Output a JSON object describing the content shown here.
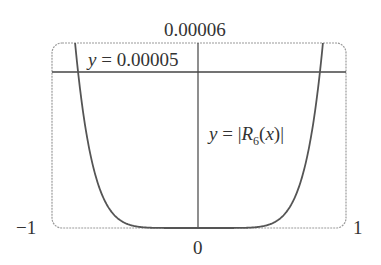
{
  "chart_data": {
    "type": "line",
    "title": "",
    "xlabel": "",
    "ylabel": "",
    "xlim": [
      -1,
      1
    ],
    "ylim": [
      0,
      6e-05
    ],
    "x_tick_labels": [
      "-1",
      "0",
      "1"
    ],
    "y_tick_labels": [
      "0.00006"
    ],
    "grid": false,
    "series": [
      {
        "name": "y = |R6(x)|",
        "function": "|x|^7/5040",
        "x": [
          -0.84,
          -0.82,
          -0.8,
          -0.75,
          -0.7,
          -0.6,
          -0.5,
          -0.4,
          -0.3,
          -0.2,
          0,
          0.2,
          0.3,
          0.4,
          0.5,
          0.6,
          0.7,
          0.75,
          0.8,
          0.82,
          0.84
        ],
        "y": [
          6e-05,
          5e-05,
          4.16e-05,
          2.65e-05,
          1.63e-05,
          5.6e-06,
          1.6e-06,
          3e-07,
          4e-08,
          0.0,
          0.0,
          0.0,
          4e-08,
          3e-07,
          1.6e-06,
          5.6e-06,
          1.63e-05,
          2.65e-05,
          4.16e-05,
          5e-05,
          6e-05
        ]
      },
      {
        "name": "y = 0.00005",
        "x": [
          -1,
          1
        ],
        "y": [
          5e-05,
          5e-05
        ]
      }
    ],
    "annotations": [
      "y = 0.00005",
      "y = |R6(x)|"
    ]
  },
  "labels": {
    "ytop": "0.00006",
    "xmin": "−1",
    "xmax": "1",
    "xzero": "0",
    "hline_y": "y",
    "hline_eq": " = 0.00005",
    "curve_y": "y",
    "curve_eq_a": " = |",
    "curve_R": "R",
    "curve_sub": "6",
    "curve_paren_open": "(",
    "curve_x": "x",
    "curve_eq_b": ")|"
  }
}
